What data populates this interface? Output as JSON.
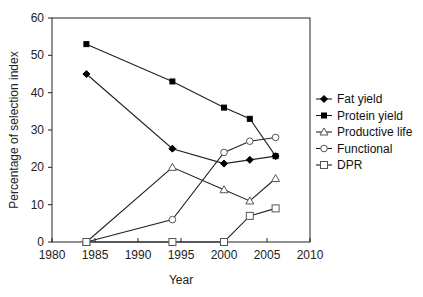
{
  "chart_data": {
    "type": "line",
    "title": "",
    "xlabel": "Year",
    "ylabel": "Percentage of selection index",
    "xlim": [
      1980,
      2010
    ],
    "ylim": [
      0,
      60
    ],
    "xticks": [
      1980,
      1985,
      1990,
      1995,
      2000,
      2005,
      2010
    ],
    "yticks": [
      0,
      10,
      20,
      30,
      40,
      50,
      60
    ],
    "grid": false,
    "legend_position": "right",
    "series": [
      {
        "name": "Fat yield",
        "marker": "diamond-filled",
        "x": [
          1984,
          1994,
          2000,
          2003,
          2006
        ],
        "values": [
          45,
          25,
          21,
          22,
          23
        ]
      },
      {
        "name": "Protein yield",
        "marker": "square-filled",
        "x": [
          1984,
          1994,
          2000,
          2003,
          2006
        ],
        "values": [
          53,
          43,
          36,
          33,
          23
        ]
      },
      {
        "name": "Productive life",
        "marker": "triangle-open",
        "x": [
          1984,
          1994,
          2000,
          2003,
          2006
        ],
        "values": [
          0,
          20,
          14,
          11,
          17
        ]
      },
      {
        "name": "Functional",
        "marker": "circle-open",
        "x": [
          1984,
          1994,
          2000,
          2003,
          2006
        ],
        "values": [
          0,
          6,
          24,
          27,
          28
        ]
      },
      {
        "name": "DPR",
        "marker": "square-open",
        "x": [
          1984,
          1994,
          2000,
          2003,
          2006
        ],
        "values": [
          0,
          0,
          0,
          7,
          9
        ]
      }
    ]
  }
}
